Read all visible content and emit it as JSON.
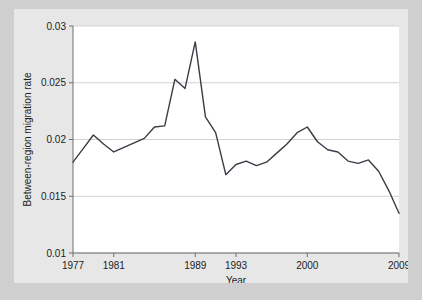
{
  "figure": {
    "background_color": "#e7e7e7",
    "page_background_color": "#cfcfcf",
    "plot_background_color": "#ffffff"
  },
  "chart_data": {
    "type": "line",
    "title": "",
    "xlabel": "Year",
    "ylabel": "Between-region migration rate",
    "xlim": [
      1977,
      2009
    ],
    "ylim": [
      0.01,
      0.03
    ],
    "grid": true,
    "legend": "none",
    "line_color": "#3b3b46",
    "x_tick_labels": [
      "1977",
      "1981",
      "1989",
      "1993",
      "2000",
      "2009"
    ],
    "x_tick_values": [
      1977,
      1981,
      1989,
      1993,
      2000,
      2009
    ],
    "y_tick_labels": [
      "0.01",
      "0.015",
      "0.02",
      "0.025",
      "0.03"
    ],
    "y_tick_values": [
      0.01,
      0.015,
      0.02,
      0.025,
      0.03
    ],
    "series": [
      {
        "name": "Between-region migration rate",
        "x": [
          1977,
          1978,
          1979,
          1980,
          1981,
          1982,
          1983,
          1984,
          1985,
          1986,
          1987,
          1988,
          1989,
          1990,
          1991,
          1992,
          1993,
          1994,
          1995,
          1996,
          1997,
          1998,
          1999,
          2000,
          2001,
          2002,
          2003,
          2004,
          2005,
          2006,
          2007,
          2008,
          2009
        ],
        "values": [
          0.018,
          0.0192,
          0.0204,
          0.0196,
          0.0189,
          0.0193,
          0.0197,
          0.0201,
          0.0211,
          0.0212,
          0.0253,
          0.0245,
          0.0286,
          0.022,
          0.0206,
          0.0169,
          0.0178,
          0.0181,
          0.0177,
          0.018,
          0.0188,
          0.0196,
          0.0206,
          0.0211,
          0.0198,
          0.0191,
          0.0189,
          0.0181,
          0.0179,
          0.0182,
          0.0172,
          0.0155,
          0.0135
        ],
        "values_note": "estimated from axis gridlines"
      }
    ],
    "annotations": []
  }
}
